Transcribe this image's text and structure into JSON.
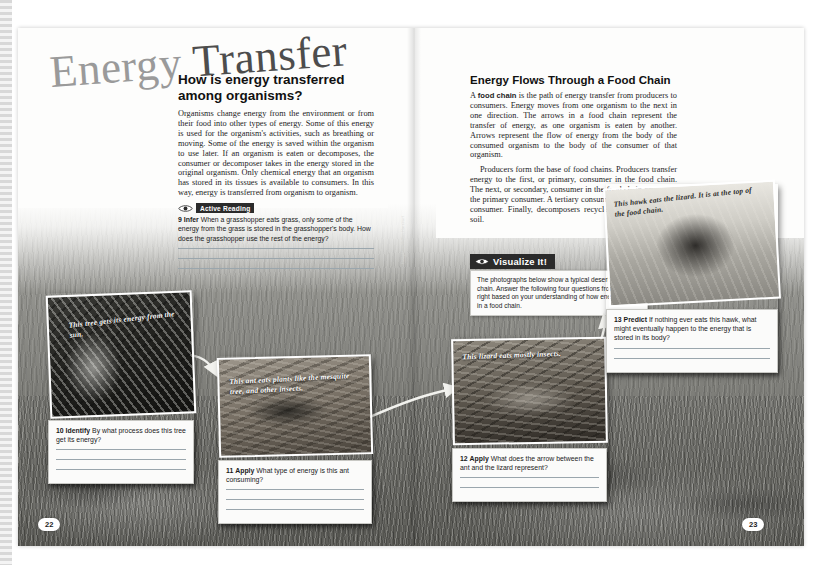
{
  "document": {
    "title": "Energy Transfer",
    "title_part1": "Energy",
    "title_part2": "Transfer",
    "page_left": "22",
    "page_right": "23",
    "credit": "Houghton Mifflin Harcourt"
  },
  "left_page": {
    "section_heading": "How is energy transferred among organisms?",
    "paragraphs": [
      "Organisms change energy from the environment or from their food into other types of energy. Some of this energy is used for the organism's activities, such as breathing or moving. Some of the energy is saved within the organism to use later. If an organism is eaten or decomposes, the consumer or decomposer takes in the energy stored in the original organism. Only chemical energy that an organism has stored in its tissues is available to consumers. In this way, energy is transferred from organism to organism."
    ],
    "active_reading": {
      "badge": "Active Reading",
      "number": "9",
      "verb": "Infer",
      "question": "When a grasshopper eats grass, only some of the energy from the grass is stored in the grasshopper's body. How does the grasshopper use the rest of the energy?",
      "answer_lines": 3
    }
  },
  "right_page": {
    "section_heading": "Energy Flows Through a Food Chain",
    "paragraph1_pre": "A ",
    "paragraph1_term": "food chain",
    "paragraph1_post": " is the path of energy transfer from producers to consumers. Energy moves from one organism to the next in one direction. The arrows in a food chain represent the transfer of energy, as one organism is eaten by another. Arrows represent the flow of energy from the body of the consumed organism to the body of the consumer of that organism.",
    "paragraph2": "Producers form the base of food chains. Producers transfer energy to the first, or primary, consumer in the food chain. The next, or secondary, consumer in the food chain consumes the primary consumer. A tertiary consumer eats the secondary consumer. Finally, decomposers recycle matter back to the soil.",
    "visualize": {
      "tab_label": "Visualize It!",
      "body": "The photographs below show a typical desert food chain. Answer the following four questions from left to right based on your understanding of how energy flows in a food chain."
    }
  },
  "photos": [
    {
      "id": "tree",
      "caption": "This tree gets its energy from the sun.",
      "question": {
        "number": "10",
        "verb": "Identify",
        "text": "By what process does this tree get its energy?",
        "answer_lines": 3
      }
    },
    {
      "id": "ant",
      "caption": "This ant eats plants like the mesquite tree, and other insects.",
      "question": {
        "number": "11",
        "verb": "Apply",
        "text": "What type of energy is this ant consuming?",
        "answer_lines": 3
      }
    },
    {
      "id": "lizard",
      "caption": "This lizard eats mostly insects.",
      "question": {
        "number": "12",
        "verb": "Apply",
        "text": "What does the arrow between the ant and the lizard represent?",
        "answer_lines": 2
      }
    },
    {
      "id": "hawk",
      "caption": "This hawk eats the lizard. It is at the top of the food chain.",
      "question": {
        "number": "13",
        "verb": "Predict",
        "text": "If nothing ever eats this hawk, what might eventually happen to the energy that is stored in its body?",
        "answer_lines": 2
      }
    }
  ],
  "colors": {
    "badge_dark": "#2b2b2b",
    "title_gray": "#9a9a9a",
    "title_dark": "#4d4d4d",
    "rule_blue_gray": "#9aa6ad",
    "paper": "#fdfdfc"
  }
}
